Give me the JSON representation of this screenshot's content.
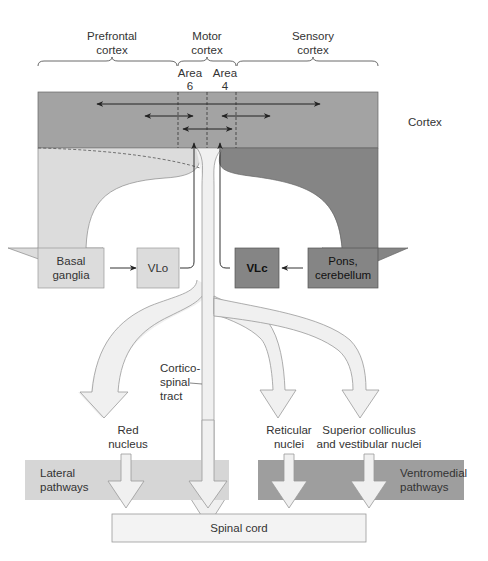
{
  "colors": {
    "cortex": "#a3a3a3",
    "light_fill": "#dcdcdc",
    "dark_fill": "#858585",
    "pale_fill": "#f0f0f0",
    "lateral_band": "#d6d6d6",
    "ventromedial_band": "#9e9e9e",
    "line": "#333333",
    "outline": "#8a8a8a"
  },
  "regions": {
    "prefrontal": [
      "Prefrontal",
      "cortex"
    ],
    "motor": [
      "Motor",
      "cortex"
    ],
    "sensory": [
      "Sensory",
      "cortex"
    ],
    "area6": [
      "Area",
      "6"
    ],
    "area4": [
      "Area",
      "4"
    ]
  },
  "cortex_label": "Cortex",
  "boxes": {
    "basal_ganglia": [
      "Basal",
      "ganglia"
    ],
    "vlo": "VLo",
    "vlc": "VLc",
    "pons_cerebellum": [
      "Pons,",
      "cerebellum"
    ]
  },
  "tracts": {
    "corticospinal": [
      "Cortico-",
      "spinal",
      "tract"
    ],
    "red_nucleus": [
      "Red",
      "nucleus"
    ],
    "reticular": [
      "Reticular",
      "nuclei"
    ],
    "superior": [
      "Superior colliculus",
      "and vestibular nuclei"
    ]
  },
  "pathways": {
    "lateral": [
      "Lateral",
      "pathways"
    ],
    "ventromedial": [
      "Ventromedial",
      "pathways"
    ]
  },
  "spinal_cord": "Spinal cord"
}
